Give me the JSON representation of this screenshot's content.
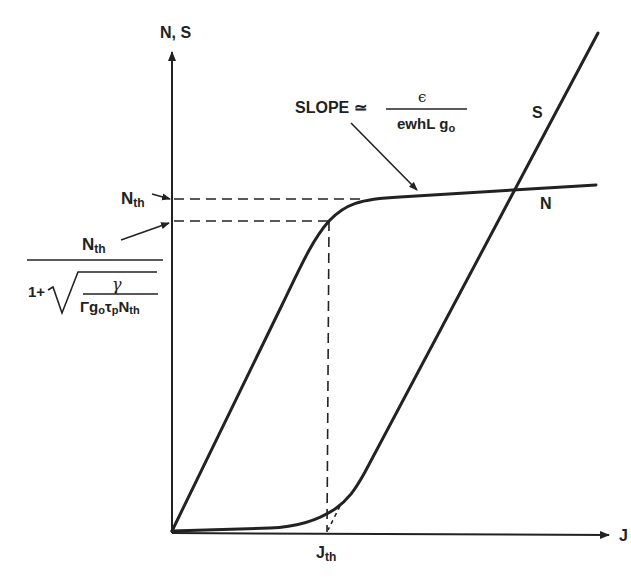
{
  "diagram": {
    "type": "laser threshold characteristic (carrier density N and photon density S vs. current density J)",
    "colors": {
      "ink": "#222222",
      "background": "#ffffff"
    },
    "axes": {
      "y_label": "N, S",
      "x_label": "J"
    },
    "curves": {
      "n_label": "N",
      "s_label": "S"
    },
    "y_markers": {
      "upper": {
        "main": "N",
        "sub": "th"
      },
      "lower": {
        "numerator_main": "N",
        "numerator_sub": "th",
        "denom_prefix": "1+",
        "sqrt_numerator": "γ",
        "sqrt_denominator": {
          "gamma": "Γ",
          "g": "g",
          "g_sub": "o",
          "tau": "τ",
          "tau_sub": "p",
          "n": "N",
          "n_sub": "th"
        }
      }
    },
    "x_marker": {
      "main": "J",
      "sub": "th"
    },
    "slope_annotation": {
      "label": "SLOPE ≃",
      "numerator": "ϵ",
      "denominator_main": "ewhL g",
      "denominator_sub": "o"
    }
  }
}
